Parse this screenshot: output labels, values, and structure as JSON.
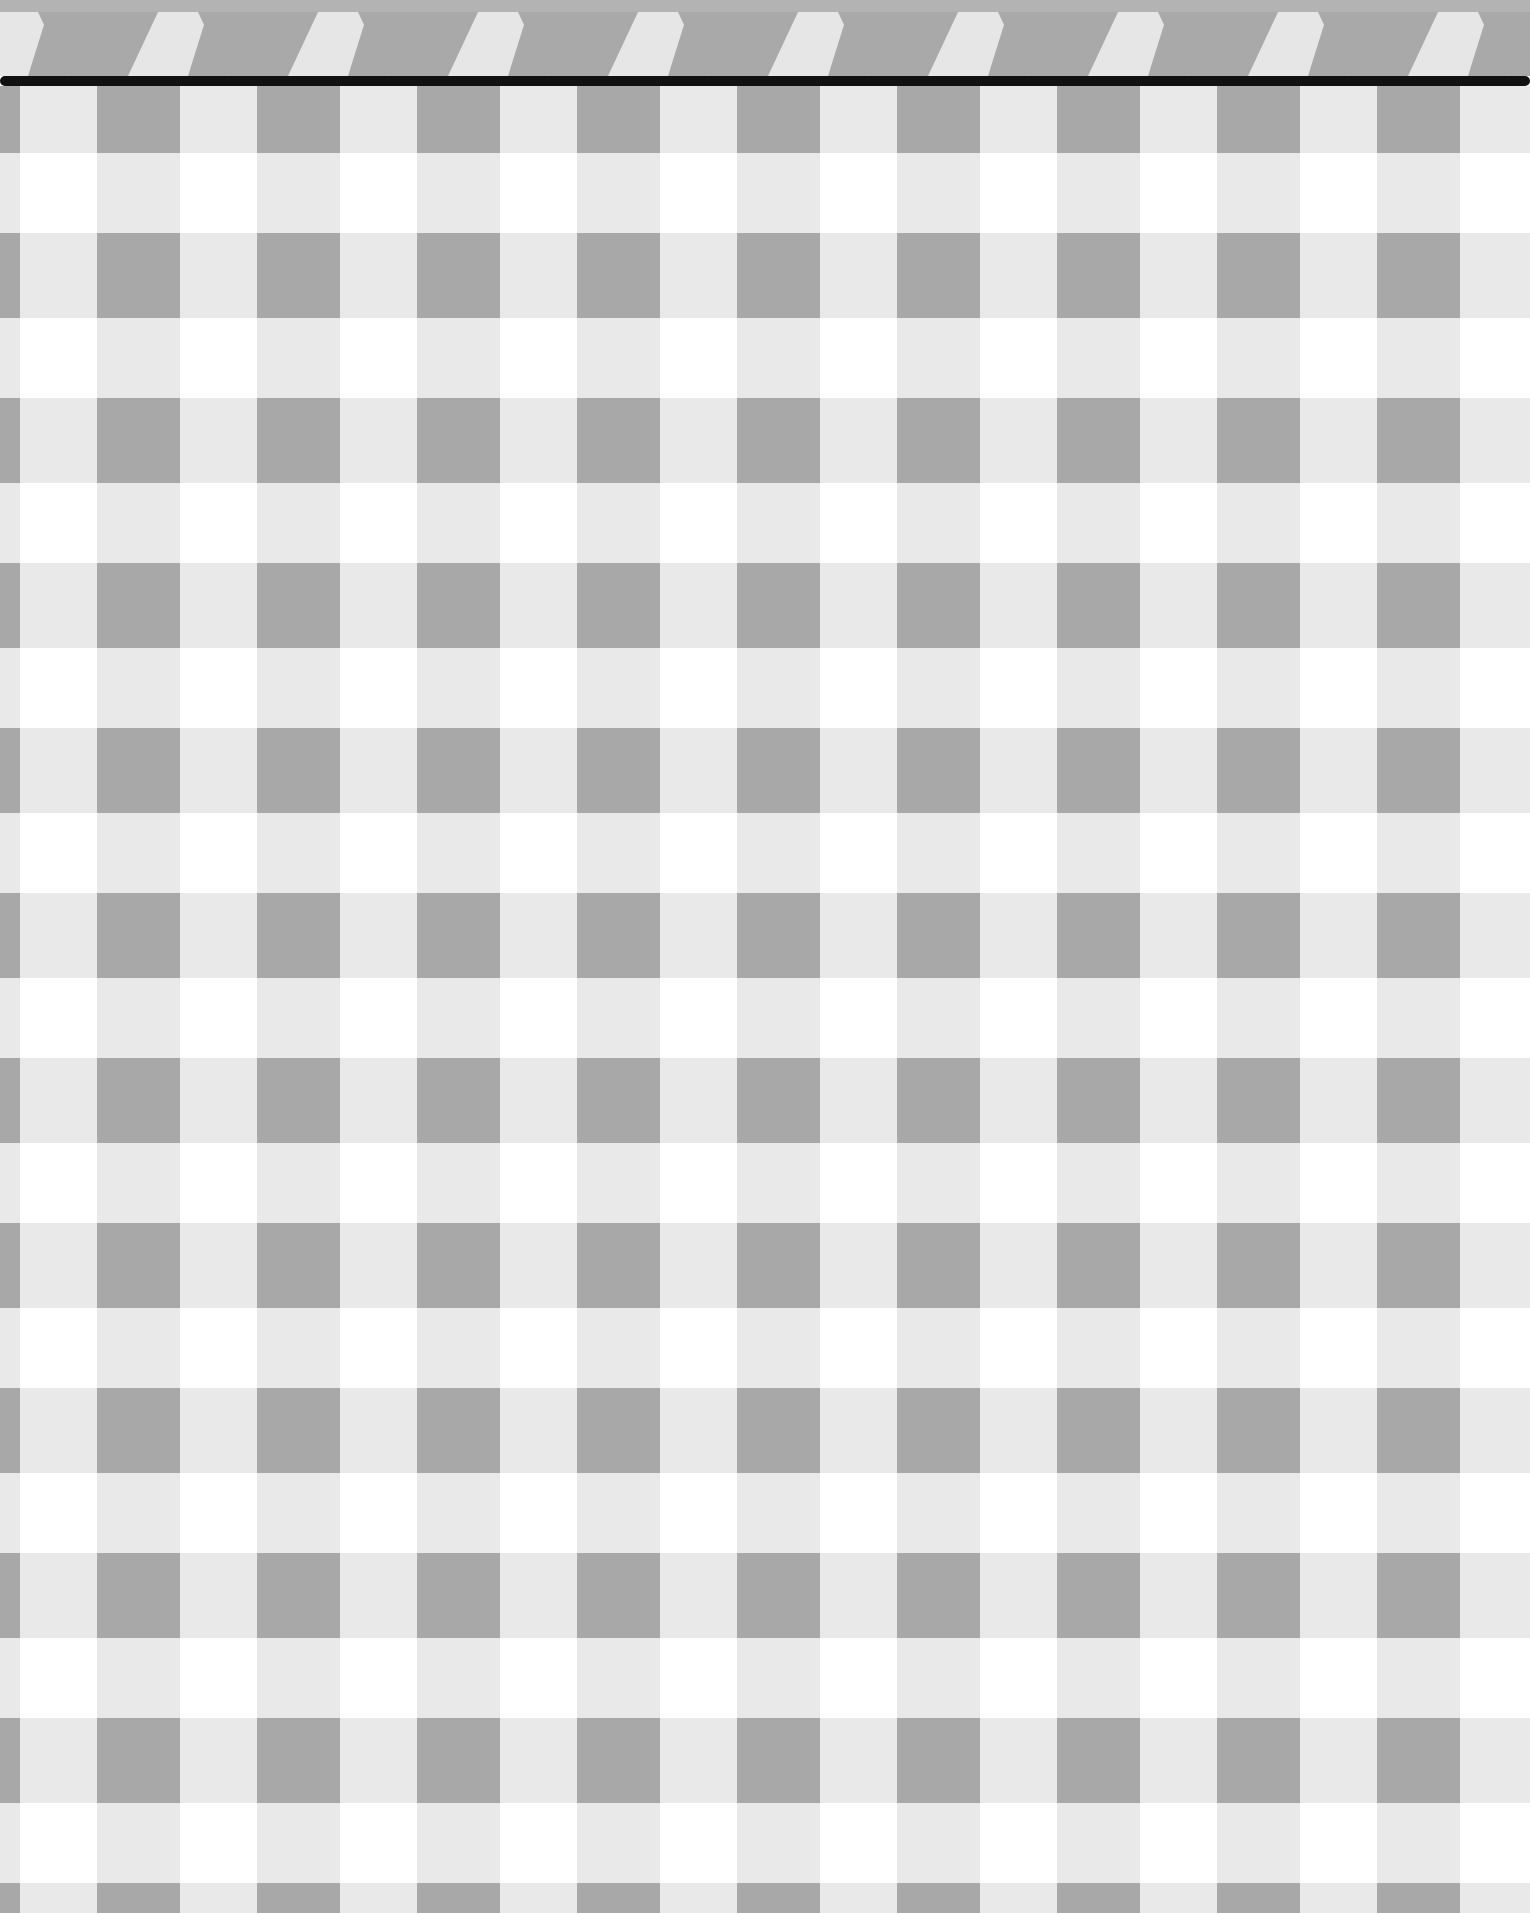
{
  "pattern": {
    "type": "gingham",
    "colors": {
      "white": "#ffffff",
      "light": "#e9e9e9",
      "dark": "#a8a8a8",
      "band": "#b3b3b3",
      "bunting_light": "#e6e6e6",
      "bunting_dark": "#a9a9a9",
      "line": "#111111"
    },
    "cell": {
      "period_x": 160,
      "period_y": 165,
      "dark_width": 83,
      "dark_height": 85,
      "offset_x": 97,
      "offset_y": 147
    }
  }
}
